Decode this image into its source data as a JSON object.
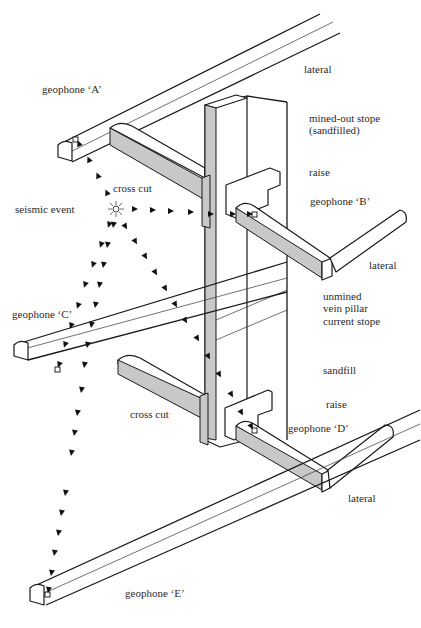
{
  "diagram": {
    "labels": {
      "lateral_top": "lateral",
      "geophone_a": "geophone ‘A’",
      "mined_out_stope_1": "mined-out stope",
      "mined_out_stope_2": "(sandfilled)",
      "cross_cut_top": "cross cut",
      "raise_top": "raise",
      "seismic_event": "seismic event",
      "geophone_b": "geophone ‘B’",
      "lateral_mid": "lateral",
      "unmined": "unmined",
      "vein_pillar": "vein pillar",
      "current_stope": "current stope",
      "geophone_c": "geophone ‘C’",
      "sandfill": "sandfill",
      "cross_cut_bottom": "cross cut",
      "raise_bottom": "raise",
      "geophone_d": "geophone ‘D’",
      "lateral_bottom": "lateral",
      "geophone_e": "geophone ‘E’"
    },
    "colors": {
      "line": "#1a1a1a",
      "shade": "#c8c8c8",
      "background": "#ffffff"
    }
  }
}
